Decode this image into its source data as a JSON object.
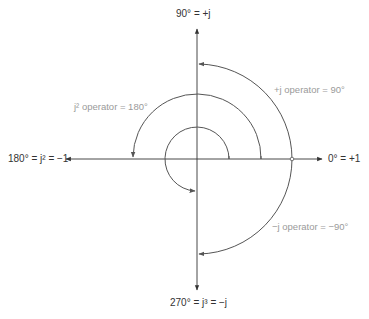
{
  "diagram": {
    "center": {
      "x": 197,
      "y": 159
    },
    "colors": {
      "axis": "#333333",
      "arc": "#555555",
      "axis_label": "#333333",
      "operator_label": "#9a9a9a"
    },
    "axis_labels": {
      "top": "90° = +j",
      "right": "0° = +1",
      "left": "180° = j² = −1",
      "bottom": "270° = j³ = −j"
    },
    "operator_labels": {
      "plus_j": "+j operator = 90°",
      "j_squared": "j² operator = 180°",
      "minus_j": "−j operator = −90°"
    },
    "arcs": [
      {
        "name": "plus-j-arc",
        "radius": 95,
        "from_deg": 0,
        "to_deg": 90
      },
      {
        "name": "minus-j-arc",
        "radius": 95,
        "from_deg": 0,
        "to_deg": -90
      },
      {
        "name": "j-squared-arc",
        "radius": 64,
        "from_deg": 0,
        "to_deg": 180
      },
      {
        "name": "j-cubed-arc",
        "radius": 32,
        "from_deg": 0,
        "to_deg": 270
      }
    ]
  }
}
